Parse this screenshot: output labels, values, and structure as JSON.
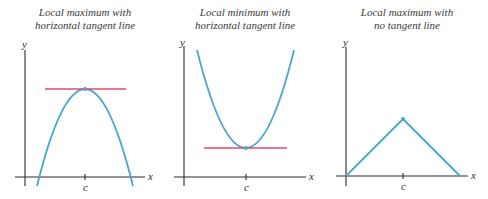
{
  "figure": {
    "colors": {
      "curve": "#4aa6cc",
      "tangent": "#e04870",
      "axis": "#2b2b2b",
      "text": "#3a3a3a"
    },
    "panels": [
      {
        "id": "local-maximum-horizontal-tangent",
        "title_line1": "Local maximum with",
        "title_line2": "horizontal tangent line",
        "y_label": "y",
        "x_label": "x",
        "tick_label": "c",
        "curve_type": "downward parabola",
        "critical_point": "maximum",
        "tangent": "horizontal"
      },
      {
        "id": "local-minimum-horizontal-tangent",
        "title_line1": "Local minimum with",
        "title_line2": "horizontal tangent line",
        "y_label": "y",
        "x_label": "x",
        "tick_label": "c",
        "curve_type": "upward parabola",
        "critical_point": "minimum",
        "tangent": "horizontal"
      },
      {
        "id": "local-maximum-no-tangent",
        "title_line1": "Local maximum with",
        "title_line2": "no tangent line",
        "y_label": "y",
        "x_label": "x",
        "tick_label": "c",
        "curve_type": "corner (absolute-value peak)",
        "critical_point": "maximum",
        "tangent": "none"
      }
    ]
  }
}
